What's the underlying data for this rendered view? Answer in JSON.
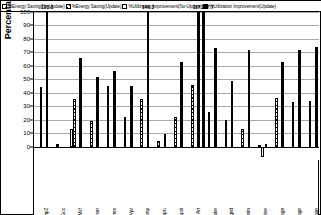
{
  "legend": {
    "items": [
      {
        "label": "%Energy Saving(No-Update)",
        "swatch": "open-white",
        "key": "es_nu"
      },
      {
        "label": "%Energy  Saving(Update)",
        "swatch": "hatched",
        "key": "es_u"
      },
      {
        "label": "%Utilization Improvement(No-Update)",
        "swatch": "open-white",
        "key": "ui_nu"
      },
      {
        "label": "%Utilization Improvement(Update)",
        "swatch": "solid-black",
        "key": "ui_u"
      }
    ]
  },
  "axes": {
    "ylabel": "Percentage",
    "yticks": [
      "100",
      "90",
      "80",
      "70",
      "60",
      "50",
      "40",
      "30",
      "20",
      "10",
      "0"
    ]
  },
  "chart_data": {
    "type": "bar",
    "title": "",
    "xlabel": "",
    "ylabel": "Percentage",
    "ylim": [
      -10,
      100
    ],
    "grid": true,
    "legend_position": "top",
    "categories": [
      "Bzip2",
      "Gcc",
      "Mcf",
      "Parser",
      "Vortex",
      "Vpr",
      "Ammp",
      "Applu",
      "Apsi",
      "Art",
      "Equake",
      "Mgrid",
      "Swim",
      "Wupwise",
      "Int. Average",
      "FP Average",
      "Average"
    ],
    "series": [
      {
        "name": "%Energy Saving(No-Update)",
        "values": [
          0,
          0,
          13,
          0,
          0,
          0,
          0,
          0,
          0,
          0,
          0,
          0,
          0,
          0,
          0,
          0,
          0
        ]
      },
      {
        "name": "%Energy Saving(Update)",
        "values": [
          44,
          2,
          35,
          19,
          45,
          22,
          35,
          4,
          22,
          46,
          26,
          20,
          13,
          1,
          36,
          33,
          34
        ]
      },
      {
        "name": "%Utilization Improvement(No-Update)",
        "values": [
          0,
          0,
          0,
          0,
          0,
          0,
          0,
          0,
          0,
          0,
          0,
          0,
          0,
          -8,
          0,
          0,
          0
        ]
      },
      {
        "name": "%Utilization Improvement(Update)",
        "values": [
          123.8,
          0,
          66,
          52,
          56,
          45,
          146.3,
          9,
          63,
          117.2,
          73,
          49,
          72,
          2,
          63,
          72,
          74
        ]
      }
    ],
    "data_labels": [
      {
        "category": "Bzip2",
        "value": "123.8"
      },
      {
        "category": "Ammp",
        "value": "146.3"
      },
      {
        "category": "Art",
        "value": "117.2"
      },
      {
        "category": "Art2",
        "value": "167.7"
      }
    ]
  }
}
